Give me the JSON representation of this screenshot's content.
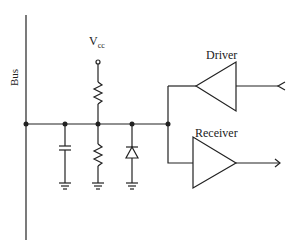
{
  "diagram": {
    "type": "bus interface circuit schematic",
    "labels": {
      "bus": "Bus",
      "vcc_main": "V",
      "vcc_sub": "cc",
      "driver": "Driver",
      "receiver": "Receiver"
    },
    "components": [
      {
        "name": "bus-line",
        "kind": "wire"
      },
      {
        "name": "pull-up-resistor",
        "kind": "resistor",
        "to": "Vcc"
      },
      {
        "name": "bus-capacitor",
        "kind": "capacitor",
        "to": "ground"
      },
      {
        "name": "pull-down-resistor",
        "kind": "resistor",
        "to": "ground"
      },
      {
        "name": "clamp-diode",
        "kind": "diode",
        "to": "ground"
      },
      {
        "name": "driver",
        "kind": "buffer",
        "direction": "into bus"
      },
      {
        "name": "receiver",
        "kind": "buffer",
        "direction": "out of bus"
      }
    ],
    "colors": {
      "line": "#222222",
      "background": "#ffffff"
    }
  }
}
